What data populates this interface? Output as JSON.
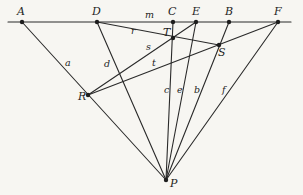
{
  "diagram": {
    "type": "projective-geometry-figure",
    "stroke_color": "#2a2a2a",
    "background_color": "#f7f6f2",
    "baseline": {
      "name": "m",
      "label": "m",
      "from": [
        8,
        22
      ],
      "to": [
        291,
        22
      ]
    },
    "points": {
      "A": {
        "label": "A",
        "x": 22,
        "y": 22
      },
      "D": {
        "label": "D",
        "x": 97,
        "y": 22
      },
      "C": {
        "label": "C",
        "x": 173,
        "y": 22
      },
      "E": {
        "label": "E",
        "x": 196,
        "y": 22
      },
      "B": {
        "label": "B",
        "x": 229,
        "y": 22
      },
      "F": {
        "label": "F",
        "x": 278,
        "y": 22
      },
      "T": {
        "label": "T",
        "x": 173,
        "y": 38
      },
      "S": {
        "label": "S",
        "x": 219,
        "y": 45
      },
      "R": {
        "label": "R",
        "x": 88,
        "y": 95
      },
      "P": {
        "label": "P",
        "x": 166,
        "y": 180
      }
    },
    "lines": [
      {
        "name": "a",
        "label": "a",
        "from": "A",
        "to": "P"
      },
      {
        "name": "d",
        "label": "d",
        "from": "D",
        "to": "P"
      },
      {
        "name": "c",
        "label": "c",
        "from": "C",
        "to": "P"
      },
      {
        "name": "e",
        "label": "e",
        "from": "E",
        "to": "P"
      },
      {
        "name": "b",
        "label": "b",
        "from": "B",
        "to": "P"
      },
      {
        "name": "f",
        "label": "f",
        "from": "F",
        "to": "P"
      },
      {
        "name": "r",
        "label": "r",
        "from": "D",
        "to": "S"
      },
      {
        "name": "s",
        "label": "s",
        "from": "R",
        "to": "E"
      },
      {
        "name": "t",
        "label": "t",
        "from": "R",
        "to": "F"
      }
    ],
    "labels": {
      "A": "A",
      "D": "D",
      "C": "C",
      "E": "E",
      "B": "B",
      "F": "F",
      "T": "T",
      "S": "S",
      "R": "R",
      "P": "P",
      "m": "m",
      "r": "r",
      "s": "s",
      "t": "t",
      "a": "a",
      "d": "d",
      "c": "c",
      "e": "e",
      "b": "b",
      "f": "f"
    }
  }
}
